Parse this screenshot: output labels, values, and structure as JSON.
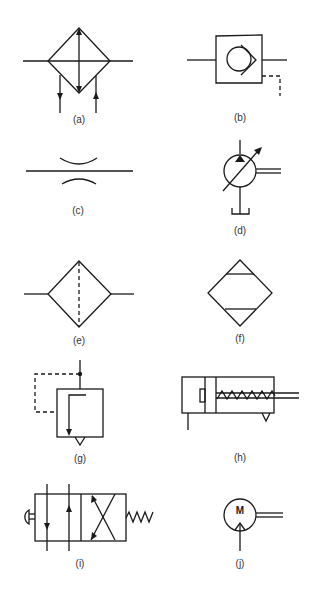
{
  "figure": {
    "line_color": "#1a1a1a",
    "background": "#ffffff",
    "panels": [
      {
        "id": "a",
        "label": "(a)",
        "symbol": "heat-exchanger-cooler"
      },
      {
        "id": "b",
        "label": "(b)",
        "symbol": "pilot-operated-check-valve"
      },
      {
        "id": "c",
        "label": "(c)",
        "symbol": "fixed-restrictor-orifice"
      },
      {
        "id": "d",
        "label": "(d)",
        "symbol": "variable-displacement-pump"
      },
      {
        "id": "e",
        "label": "(e)",
        "symbol": "filter-strainer"
      },
      {
        "id": "f",
        "label": "(f)",
        "symbol": "lubricator"
      },
      {
        "id": "g",
        "label": "(g)",
        "symbol": "pressure-relief-valve"
      },
      {
        "id": "h",
        "label": "(h)",
        "symbol": "single-acting-spring-return-cylinder"
      },
      {
        "id": "i",
        "label": "(i)",
        "symbol": "4-2-directional-valve-push-button-spring-return"
      },
      {
        "id": "j",
        "label": "(j)",
        "symbol": "pneumatic-motor",
        "text": "M"
      }
    ]
  }
}
